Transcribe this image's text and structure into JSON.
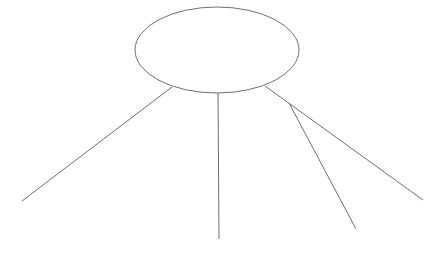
{
  "diagram": {
    "width": 447,
    "height": 254,
    "background": "#ffffff",
    "stroke_color": "#6e6e6e",
    "stroke_width": 1,
    "ellipse": {
      "cx": 217,
      "cy": 50,
      "rx": 82,
      "ry": 43,
      "fill": "#ffffff"
    },
    "lines": [
      {
        "name": "left-branch",
        "x1": 172,
        "y1": 87,
        "x2": 22,
        "y2": 201
      },
      {
        "name": "center-branch",
        "x1": 218,
        "y1": 93,
        "x2": 219,
        "y2": 239
      },
      {
        "name": "right-branch",
        "x1": 265,
        "y1": 86,
        "x2": 423,
        "y2": 200
      },
      {
        "name": "sub-branch",
        "x1": 289,
        "y1": 103,
        "x2": 356,
        "y2": 229
      }
    ]
  }
}
